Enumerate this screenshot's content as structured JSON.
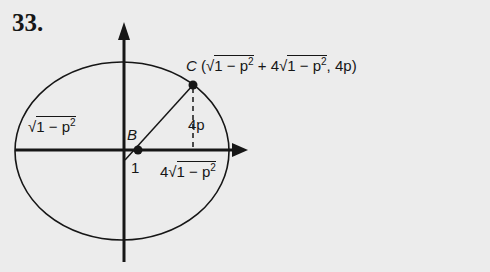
{
  "problem_number": "33.",
  "labels": {
    "point_c": "C",
    "point_c_open": "(",
    "point_c_x_part1_radicand": "1 − p",
    "point_c_x_part1_exp": "2",
    "point_c_plus": " + 4",
    "point_c_x_part2_radicand": "1 − p",
    "point_c_x_part2_exp": "2",
    "point_c_rest": ", 4p)",
    "point_b": "B",
    "left_radicand": "1 − p",
    "left_exp": "2",
    "height_label": "4p",
    "unit_label": "1",
    "bottom_coef": "4",
    "bottom_radicand": "1 − p",
    "bottom_exp": "2",
    "sqrt_symbol": "√"
  },
  "colors": {
    "background": "#ececec",
    "ink": "#161616"
  }
}
